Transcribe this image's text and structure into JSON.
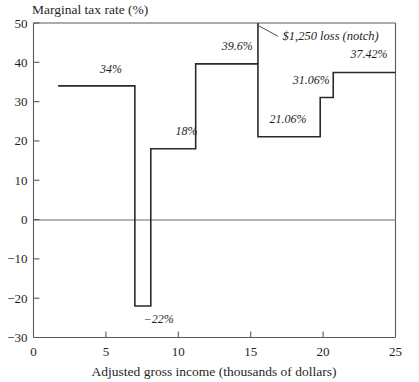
{
  "chart_data": {
    "type": "line",
    "subtype": "step",
    "title": "",
    "ylabel": "Marginal tax rate (%)",
    "xlabel": "Adjusted gross income (thousands of dollars)",
    "xlim": [
      0,
      25
    ],
    "ylim": [
      -30,
      50
    ],
    "xticks": [
      0,
      5,
      10,
      15,
      20,
      25
    ],
    "xtick_labels": [
      "0",
      "5",
      "10",
      "15",
      "20",
      "25"
    ],
    "yticks": [
      -30,
      -20,
      -10,
      0,
      10,
      20,
      30,
      40,
      50
    ],
    "ytick_labels": [
      "−30",
      "−20",
      "−10",
      "0",
      "10",
      "20",
      "30",
      "40",
      "50"
    ],
    "grid": false,
    "legend": false,
    "zero_line": true,
    "segments": [
      {
        "x_start": 1.7,
        "x_end": 7.0,
        "value": 34,
        "label": "34%",
        "label_x": 4.6,
        "label_y": 37.4
      },
      {
        "x_start": 7.0,
        "x_end": 8.1,
        "value": -22,
        "label": "−22%",
        "label_x": 7.6,
        "label_y": -26.2
      },
      {
        "x_start": 8.1,
        "x_end": 11.2,
        "value": 18,
        "label": "18%",
        "label_x": 9.8,
        "label_y": 21.6
      },
      {
        "x_start": 11.2,
        "x_end": 15.5,
        "value": 39.6,
        "label": "39.6%",
        "label_x": 13.0,
        "label_y": 43.2
      },
      {
        "x_start": 15.5,
        "x_end": 19.8,
        "value": 21.06,
        "label": "21.06%",
        "label_x": 16.3,
        "label_y": 24.6
      },
      {
        "x_start": 19.8,
        "x_end": 20.7,
        "value": 31.06,
        "label": "31.06%",
        "label_x": 17.9,
        "label_y": 34.6
      },
      {
        "x_start": 20.7,
        "x_end": 25.0,
        "value": 37.42,
        "label": "37.42%",
        "label_x": 21.9,
        "label_y": 41.2
      }
    ],
    "notch": {
      "x_start": 7.0,
      "x_end": 8.1,
      "top_value": 50,
      "bottom_value": -22
    },
    "annotations": [
      {
        "text": "$1,250 loss (notch)",
        "text_x": 17.2,
        "text_y": 45.6,
        "leader_from_x": 15.5,
        "leader_from_y": 49.4,
        "leader_to_x": 16.9,
        "leader_to_y": 46.6
      }
    ],
    "colors": {
      "step_line": "#2a2a2a",
      "axis": "#5b5b5b",
      "zero_line": "#6a6a6a",
      "text": "#1f1f1f",
      "background": "#ffffff"
    }
  }
}
